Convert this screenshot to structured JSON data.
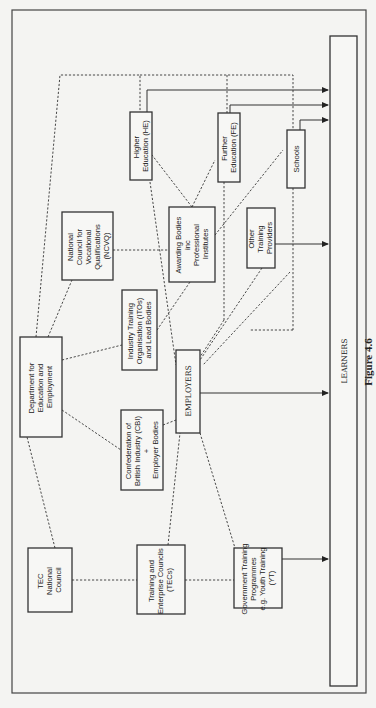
{
  "figure": {
    "caption": "Figure 4.6",
    "orientation": "rotated-90"
  },
  "nodes": {
    "tec_council": {
      "lines": [
        "TEC",
        "National",
        "Council"
      ]
    },
    "tecs": {
      "lines": [
        "Training and",
        "Enterprise Councils",
        "(TECs)"
      ]
    },
    "gov_training": {
      "lines": [
        "Government Training",
        "Programmes",
        "e.g. Youth Training",
        "(YT)"
      ]
    },
    "dfee": {
      "lines": [
        "Department for",
        "Education and",
        "Employment"
      ]
    },
    "cbi": {
      "lines": [
        "Confederation of",
        "British Industry (CBI)",
        "+",
        "Employer Bodies"
      ]
    },
    "employers": {
      "lines": [
        "EMPLOYERS"
      ]
    },
    "ito": {
      "lines": [
        "Industry Training",
        "Organisation (ITOs)",
        "and Lead Bodies"
      ]
    },
    "ncvq": {
      "lines": [
        "National",
        "Council for",
        "Vocational",
        "Qualifications",
        "(NCVQ)"
      ]
    },
    "awarding": {
      "lines": [
        "Awarding Bodies",
        "inc",
        "Professional",
        "Institutes"
      ]
    },
    "other_providers": {
      "lines": [
        "Other",
        "Training",
        "Providers"
      ]
    },
    "higher_ed": {
      "lines": [
        "Higher",
        "Education (HE)"
      ]
    },
    "further_ed": {
      "lines": [
        "Further",
        "Education (FE)"
      ]
    },
    "schools": {
      "lines": [
        "Schools"
      ]
    },
    "learners": {
      "lines": [
        "LEARNERS"
      ]
    }
  },
  "legend": {
    "dashed": "relationship / influence",
    "solid_arrow": "provision to learners"
  }
}
